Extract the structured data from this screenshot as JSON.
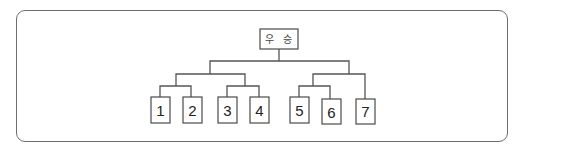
{
  "diagram": {
    "type": "tournament-bracket",
    "root": {
      "label": "우 승"
    },
    "leaves": [
      {
        "label": "1"
      },
      {
        "label": "2"
      },
      {
        "label": "3"
      },
      {
        "label": "4"
      },
      {
        "label": "5"
      },
      {
        "label": "6"
      },
      {
        "label": "7"
      }
    ],
    "structure": [
      {
        "match": "1 vs 2"
      },
      {
        "match": "3 vs 4"
      },
      {
        "match": "5 vs 6"
      },
      {
        "match": "(1-2) vs (3-4)"
      },
      {
        "match": "(5-6) vs 7"
      },
      {
        "match": "final"
      }
    ],
    "colors": {
      "stroke": "#555555",
      "text": "#222222",
      "background": "#ffffff"
    }
  }
}
